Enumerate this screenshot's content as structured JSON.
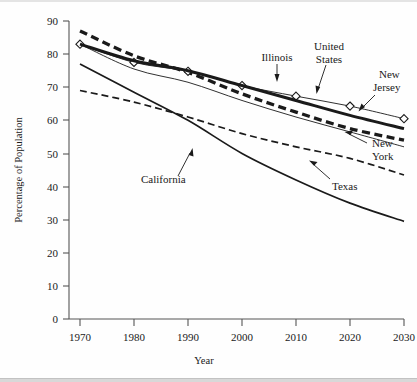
{
  "chart_data": {
    "type": "line",
    "title": "",
    "xlabel": "Year",
    "ylabel": "Percentage of Population",
    "xlim": [
      1965,
      2033
    ],
    "ylim": [
      0,
      90
    ],
    "xticks": [
      1970,
      1980,
      1990,
      2000,
      2010,
      2020,
      2030
    ],
    "yticks": [
      0,
      10,
      20,
      30,
      40,
      50,
      60,
      70,
      80,
      90
    ],
    "grid": false,
    "legend_position": "inline-annotations",
    "x": [
      1970,
      1980,
      1990,
      2000,
      2010,
      2020,
      2030
    ],
    "series": [
      {
        "name": "United States",
        "style": "thick-dashed",
        "values": [
          87.0,
          79.5,
          74.5,
          68.0,
          62.5,
          57.5,
          54.0
        ],
        "label": "United States",
        "label_lines": [
          "United",
          "States"
        ]
      },
      {
        "name": "New Jersey",
        "style": "thin-line-with-diamond-markers",
        "values": [
          83.0,
          77.5,
          74.8,
          70.5,
          67.3,
          64.3,
          60.5
        ],
        "label": "New Jersey",
        "label_lines": [
          "New",
          "Jersey"
        ],
        "markers": "diamond"
      },
      {
        "name": "Illinois",
        "style": "thick-solid",
        "values": [
          83.0,
          78.0,
          75.0,
          70.5,
          66.0,
          61.5,
          57.5
        ],
        "label": "Illinois",
        "label_lines": [
          "Illinois"
        ]
      },
      {
        "name": "New York",
        "style": "thin-solid",
        "values": [
          83.0,
          75.5,
          71.5,
          66.0,
          61.0,
          56.5,
          52.0
        ],
        "label": "New York",
        "label_lines": [
          "New",
          "York"
        ]
      },
      {
        "name": "California",
        "style": "medium-solid-curve",
        "values": [
          77.0,
          68.5,
          60.0,
          50.0,
          42.0,
          35.0,
          29.5
        ],
        "label": "California",
        "label_lines": [
          "California"
        ]
      },
      {
        "name": "Texas",
        "style": "medium-dashed",
        "values": [
          69.0,
          65.5,
          61.0,
          56.0,
          52.0,
          48.5,
          43.5
        ],
        "label": "Texas",
        "label_lines": [
          "Texas"
        ]
      }
    ],
    "annotations": [
      {
        "text": "Illinois",
        "target_series": "Illinois"
      },
      {
        "text": "United States",
        "target_series": "United States"
      },
      {
        "text": "New Jersey",
        "target_series": "New Jersey"
      },
      {
        "text": "New York",
        "target_series": "New York"
      },
      {
        "text": "California",
        "target_series": "California"
      },
      {
        "text": "Texas",
        "target_series": "Texas"
      }
    ]
  },
  "axes": {
    "y_tick_labels": [
      "90",
      "80",
      "70",
      "60",
      "50",
      "40",
      "30",
      "20",
      "10",
      "0"
    ],
    "x_tick_labels": [
      "1970",
      "1980",
      "1990",
      "2000",
      "2010",
      "2020",
      "2030"
    ],
    "y_axis_title": "Percentage of Population",
    "x_axis_title": "Year"
  },
  "annotation_labels": {
    "illinois": "Illinois",
    "united": "United",
    "states": "States",
    "new_nj": "New",
    "jersey": "Jersey",
    "new_ny": "New",
    "york": "York",
    "california": "California",
    "texas": "Texas"
  },
  "colors": {
    "ink": "#1a1a1a",
    "axis": "#555555",
    "background": "#fefefe"
  }
}
